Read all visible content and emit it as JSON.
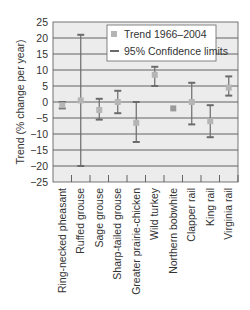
{
  "chart_data": {
    "type": "errorbar",
    "title": "",
    "xlabel": "",
    "ylabel": "Trend (% change per year)",
    "ylim": [
      -25,
      25
    ],
    "yticks": [
      25,
      20,
      15,
      10,
      5,
      0,
      -5,
      -10,
      -15,
      -20,
      -25
    ],
    "grid": true,
    "legend_position": "top-right",
    "categories": [
      "Ring-necked pheasant",
      "Ruffed grouse",
      "Sage grouse",
      "Sharp-tailed grouse",
      "Greater prairie-chicken",
      "Wild turkey",
      "Northern bobwhite",
      "Clapper rail",
      "King rail",
      "Virginia rail"
    ],
    "series": [
      {
        "name": "Trend 1966–2004",
        "values": [
          -1,
          0.5,
          -2.5,
          0,
          -6.5,
          8.5,
          -2,
          0,
          -6,
          4.5
        ]
      },
      {
        "name": "95% Confidence limits",
        "upper": [
          0,
          21,
          1,
          3.5,
          0,
          11,
          -1.5,
          6,
          -1,
          8
        ],
        "lower": [
          -2,
          -20,
          -5.5,
          -3.5,
          -12.5,
          5,
          -2.5,
          -7,
          -11,
          2
        ]
      }
    ],
    "legend": [
      "Trend 1966–2004",
      "95% Confidence limits"
    ]
  },
  "colors": {
    "plot_background": "#ececec",
    "gridline": "#555555",
    "errorbar": "#6b6b6b",
    "marker": "#b5b5b5",
    "text": "#333333"
  }
}
